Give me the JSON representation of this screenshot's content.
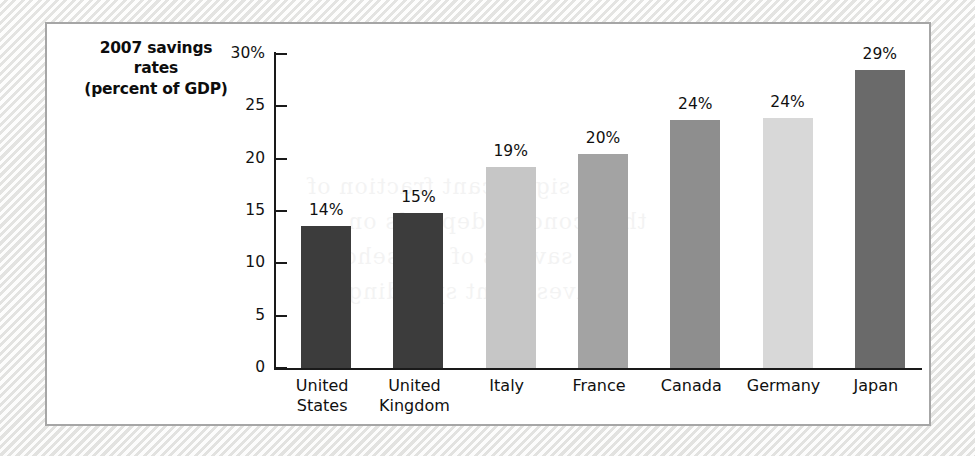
{
  "figure": {
    "title_lines": [
      "2007 savings",
      "rates",
      "(percent of GDP)"
    ],
    "panel_border_color": "#a6a6a6",
    "panel_background": "#ffffff",
    "page_background": "#f3f3f1",
    "axis_color": "#1a1a1a",
    "text_color": "#101010"
  },
  "chart_data": {
    "type": "bar",
    "xlabel": "",
    "ylabel": "",
    "ylim": [
      0,
      30
    ],
    "yticks": [
      0,
      5,
      10,
      15,
      20,
      25,
      30
    ],
    "ytick_labels": [
      "0",
      "5",
      "10",
      "15",
      "20",
      "25",
      "30%"
    ],
    "grid": false,
    "legend": false,
    "categories": [
      "United States",
      "United Kingdom",
      "Italy",
      "France",
      "Canada",
      "Germany",
      "Japan"
    ],
    "category_lines": [
      [
        "United",
        "States"
      ],
      [
        "United",
        "Kingdom"
      ],
      [
        "Italy"
      ],
      [
        "France"
      ],
      [
        "Canada"
      ],
      [
        "Germany"
      ],
      [
        "Japan"
      ]
    ],
    "values": [
      13.6,
      14.8,
      19.2,
      20.4,
      23.7,
      23.9,
      28.5
    ],
    "data_labels": [
      "14%",
      "15%",
      "19%",
      "20%",
      "24%",
      "24%",
      "29%"
    ],
    "bar_colors": [
      "#3c3c3c",
      "#3c3c3c",
      "#c6c6c6",
      "#a3a3a3",
      "#8e8e8e",
      "#d8d8d8",
      "#6a6a6a"
    ]
  },
  "ghost": {
    "lines": [
      "a significant fraction of",
      "the economy depends on",
      "savings of households",
      "investment spending"
    ]
  }
}
